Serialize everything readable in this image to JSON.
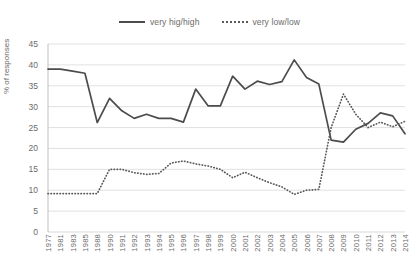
{
  "chart_data": {
    "type": "line",
    "title": "",
    "xlabel": "",
    "ylabel": "% of responses",
    "ylim": [
      0,
      45
    ],
    "ytick_step": 5,
    "yticks": [
      0,
      5,
      10,
      15,
      20,
      25,
      30,
      35,
      40,
      45
    ],
    "grid": true,
    "legend_position": "top-center",
    "categories": [
      "1977",
      "1981",
      "1983",
      "1985",
      "1988",
      "1990",
      "1991",
      "1992",
      "1993",
      "1994",
      "1995",
      "1996",
      "1997",
      "1998",
      "1999",
      "2000",
      "2001",
      "2002",
      "2003",
      "2004",
      "2005",
      "2006",
      "2007",
      "2008",
      "2009",
      "2010",
      "2011",
      "2012",
      "2013",
      "2014"
    ],
    "series": [
      {
        "name": "very hig/high",
        "style": "solid",
        "color": "#4c4c4c",
        "values": [
          39.0,
          39.0,
          38.5,
          38.0,
          26.2,
          32.0,
          29.0,
          27.2,
          28.2,
          27.2,
          27.2,
          26.3,
          34.2,
          30.2,
          30.2,
          37.3,
          34.2,
          36.1,
          35.3,
          36.0,
          41.2,
          37.0,
          35.4,
          22.0,
          21.5,
          24.6,
          26.0,
          28.5,
          27.8,
          23.5
        ]
      },
      {
        "name": "very low/low",
        "style": "dotted",
        "color": "#5a5a5a",
        "values": [
          9.2,
          9.2,
          9.2,
          9.2,
          9.2,
          15.0,
          15.0,
          14.2,
          13.8,
          14.0,
          16.5,
          17.0,
          16.3,
          15.8,
          15.0,
          13.0,
          14.3,
          13.0,
          11.8,
          10.8,
          9.0,
          10.0,
          10.2,
          25.0,
          33.0,
          28.2,
          25.0,
          26.3,
          25.2,
          26.5
        ]
      }
    ]
  },
  "legend": {
    "entries": [
      {
        "label": "very hig/high",
        "style": "solid"
      },
      {
        "label": "very low/low",
        "style": "dotted"
      }
    ]
  },
  "axes": {
    "y_title": "% of responses"
  },
  "colors": {
    "series_solid": "#4c4c4c",
    "series_dotted": "#5a5a5a",
    "gridline": "#d9d9d9",
    "axis_line": "#bfbfbf",
    "text": "#6b6b6b",
    "background": "#ffffff"
  }
}
